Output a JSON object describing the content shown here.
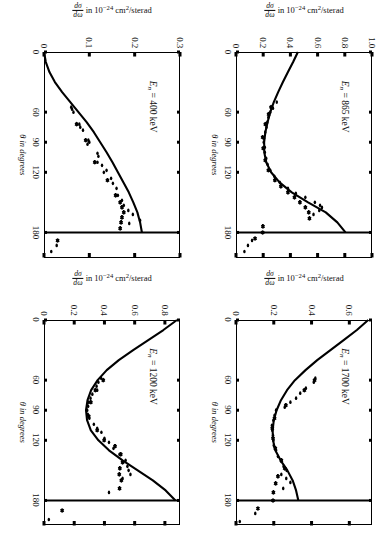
{
  "figure": {
    "panel_count": 4,
    "axis_titles": {
      "x": "θ in degrees",
      "y_numerator": "dσ",
      "y_denominator": "dω",
      "y_rest": " in 10⁻²⁴ cm²/sterad"
    }
  },
  "chart_data": [
    {
      "id": "panel-400kev",
      "type": "scatter",
      "title": "E_n = 400 keV",
      "energy_label": "E",
      "energy_sub": "n",
      "energy_value": "= 400 keV",
      "xlabel": "θ in degrees",
      "ylabel": "dσ/dω in 10⁻²⁴ cm²/sterad",
      "xlim": [
        0,
        205
      ],
      "ylim": [
        0,
        0.3
      ],
      "xticks": [
        0,
        60,
        90,
        120,
        180
      ],
      "xtick_labels": [
        "0",
        "60",
        "90",
        "120",
        "180"
      ],
      "yticks": [
        0,
        0.1,
        0.2,
        0.3
      ],
      "ytick_labels": [
        "0",
        "0.1",
        "0.2",
        "0.3"
      ],
      "grid": false,
      "legend": "none",
      "curve": [
        [
          0,
          0.0
        ],
        [
          10,
          0.004
        ],
        [
          20,
          0.012
        ],
        [
          30,
          0.024
        ],
        [
          40,
          0.04
        ],
        [
          50,
          0.058
        ],
        [
          60,
          0.076
        ],
        [
          70,
          0.094
        ],
        [
          80,
          0.11
        ],
        [
          90,
          0.124
        ],
        [
          100,
          0.138
        ],
        [
          110,
          0.151
        ],
        [
          120,
          0.163
        ],
        [
          130,
          0.175
        ],
        [
          140,
          0.187
        ],
        [
          150,
          0.197
        ],
        [
          160,
          0.206
        ],
        [
          170,
          0.212
        ],
        [
          180,
          0.216
        ]
      ],
      "vertical_line_x": 180,
      "points_filled": [
        [
          55,
          0.06
        ],
        [
          57,
          0.062
        ],
        [
          60,
          0.065
        ],
        [
          72,
          0.078
        ],
        [
          75,
          0.08
        ],
        [
          78,
          0.086
        ],
        [
          88,
          0.098
        ],
        [
          90,
          0.1
        ],
        [
          92,
          0.096
        ],
        [
          101,
          0.118
        ],
        [
          104,
          0.12
        ],
        [
          110,
          0.118
        ],
        [
          113,
          0.128
        ],
        [
          118,
          0.138
        ],
        [
          120,
          0.132
        ],
        [
          126,
          0.148
        ],
        [
          131,
          0.152
        ],
        [
          136,
          0.16
        ],
        [
          143,
          0.163
        ],
        [
          148,
          0.172
        ],
        [
          153,
          0.176
        ],
        [
          158,
          0.186
        ],
        [
          162,
          0.196
        ],
        [
          168,
          0.212
        ],
        [
          171,
          0.188
        ],
        [
          193,
          0.028
        ],
        [
          199,
          0.016
        ]
      ],
      "points_cross": [
        [
          72,
          0.072
        ],
        [
          88,
          0.092
        ],
        [
          110,
          0.112
        ],
        [
          128,
          0.14
        ],
        [
          143,
          0.158
        ],
        [
          150,
          0.168
        ],
        [
          155,
          0.172
        ],
        [
          160,
          0.176
        ],
        [
          165,
          0.172
        ],
        [
          170,
          0.17
        ],
        [
          176,
          0.168
        ],
        [
          188,
          0.03
        ]
      ]
    },
    {
      "id": "panel-865kev",
      "type": "scatter",
      "title": "E_n = 865 keV",
      "energy_label": "E",
      "energy_sub": "n",
      "energy_value": "= 865 keV",
      "xlabel": "θ in degrees",
      "ylabel": "dσ/dω in 10⁻²⁴ cm²/sterad",
      "xlim": [
        0,
        205
      ],
      "ylim": [
        0,
        1.0
      ],
      "xticks": [
        0,
        60,
        90,
        120,
        180
      ],
      "xtick_labels": [
        "0",
        "60",
        "90",
        "120",
        "180"
      ],
      "yticks": [
        0,
        0.2,
        0.4,
        0.6,
        0.8,
        1.0
      ],
      "ytick_labels": [
        "0",
        "0.2",
        "0.4",
        "0.6",
        "0.8",
        "1.0"
      ],
      "grid": false,
      "legend": "none",
      "curve": [
        [
          0,
          0.455
        ],
        [
          10,
          0.42
        ],
        [
          20,
          0.382
        ],
        [
          30,
          0.345
        ],
        [
          40,
          0.31
        ],
        [
          50,
          0.278
        ],
        [
          60,
          0.252
        ],
        [
          70,
          0.232
        ],
        [
          80,
          0.216
        ],
        [
          90,
          0.207
        ],
        [
          100,
          0.208
        ],
        [
          110,
          0.222
        ],
        [
          120,
          0.258
        ],
        [
          130,
          0.32
        ],
        [
          140,
          0.41
        ],
        [
          150,
          0.53
        ],
        [
          160,
          0.66
        ],
        [
          170,
          0.745
        ],
        [
          180,
          0.805
        ]
      ],
      "vertical_line_x": 180,
      "points_filled": [
        [
          50,
          0.3
        ],
        [
          56,
          0.272
        ],
        [
          60,
          0.252
        ],
        [
          65,
          0.238
        ],
        [
          70,
          0.23
        ],
        [
          75,
          0.224
        ],
        [
          80,
          0.215
        ],
        [
          86,
          0.206
        ],
        [
          90,
          0.204
        ],
        [
          95,
          0.212
        ],
        [
          100,
          0.212
        ],
        [
          106,
          0.222
        ],
        [
          112,
          0.232
        ],
        [
          118,
          0.252
        ],
        [
          124,
          0.282
        ],
        [
          130,
          0.322
        ],
        [
          136,
          0.382
        ],
        [
          141,
          0.44
        ],
        [
          145,
          0.51
        ],
        [
          150,
          0.58
        ],
        [
          153,
          0.618
        ],
        [
          155,
          0.632
        ],
        [
          158,
          0.612
        ],
        [
          162,
          0.57
        ],
        [
          188,
          0.118
        ],
        [
          193,
          0.088
        ],
        [
          199,
          0.062
        ]
      ],
      "points_cross": [
        [
          55,
          0.258
        ],
        [
          62,
          0.24
        ],
        [
          72,
          0.216
        ],
        [
          85,
          0.196
        ],
        [
          96,
          0.2
        ],
        [
          108,
          0.215
        ],
        [
          118,
          0.238
        ],
        [
          128,
          0.286
        ],
        [
          134,
          0.33
        ],
        [
          140,
          0.382
        ],
        [
          145,
          0.43
        ],
        [
          150,
          0.47
        ],
        [
          155,
          0.51
        ],
        [
          160,
          0.535
        ],
        [
          166,
          0.54
        ],
        [
          174,
          0.198
        ],
        [
          180,
          0.196
        ],
        [
          186,
          0.14
        ]
      ]
    },
    {
      "id": "panel-1200kev",
      "type": "scatter",
      "title": "E_n = 1200 keV",
      "energy_label": "E",
      "energy_sub": "n",
      "energy_value": "= 1200 keV",
      "xlabel": "θ in degrees",
      "ylabel": "dσ/dω in 10⁻²⁴ cm²/sterad",
      "xlim": [
        0,
        205
      ],
      "ylim": [
        0,
        0.9
      ],
      "xticks": [
        0,
        60,
        90,
        120,
        180
      ],
      "xtick_labels": [
        "0",
        "60",
        "90",
        "120",
        "180"
      ],
      "yticks": [
        0,
        0.2,
        0.4,
        0.6,
        0.8
      ],
      "ytick_labels": [
        "0",
        "0.2",
        "0.4",
        "0.6",
        "0.8"
      ],
      "grid": false,
      "legend": "none",
      "curve": [
        [
          0,
          0.88
        ],
        [
          10,
          0.79
        ],
        [
          20,
          0.69
        ],
        [
          30,
          0.59
        ],
        [
          40,
          0.495
        ],
        [
          50,
          0.415
        ],
        [
          60,
          0.355
        ],
        [
          70,
          0.312
        ],
        [
          80,
          0.288
        ],
        [
          90,
          0.278
        ],
        [
          100,
          0.285
        ],
        [
          110,
          0.31
        ],
        [
          120,
          0.36
        ],
        [
          130,
          0.43
        ],
        [
          140,
          0.52
        ],
        [
          150,
          0.62
        ],
        [
          160,
          0.72
        ],
        [
          170,
          0.805
        ],
        [
          180,
          0.87
        ]
      ],
      "vertical_line_x": 180,
      "points_filled": [
        [
          58,
          0.378
        ],
        [
          62,
          0.36
        ],
        [
          66,
          0.348
        ],
        [
          70,
          0.352
        ],
        [
          74,
          0.32
        ],
        [
          78,
          0.308
        ],
        [
          82,
          0.296
        ],
        [
          86,
          0.292
        ],
        [
          90,
          0.286
        ],
        [
          94,
          0.29
        ],
        [
          98,
          0.3
        ],
        [
          104,
          0.33
        ],
        [
          108,
          0.352
        ],
        [
          112,
          0.38
        ],
        [
          118,
          0.4
        ],
        [
          122,
          0.43
        ],
        [
          128,
          0.46
        ],
        [
          134,
          0.5
        ],
        [
          140,
          0.54
        ],
        [
          146,
          0.552
        ],
        [
          150,
          0.56
        ],
        [
          154,
          0.572
        ],
        [
          158,
          0.52
        ],
        [
          172,
          0.43
        ],
        [
          199,
          0.032
        ]
      ],
      "points_cross": [
        [
          60,
          0.392
        ],
        [
          70,
          0.34
        ],
        [
          82,
          0.31
        ],
        [
          96,
          0.296
        ],
        [
          110,
          0.352
        ],
        [
          120,
          0.398
        ],
        [
          126,
          0.47
        ],
        [
          134,
          0.508
        ],
        [
          142,
          0.52
        ],
        [
          148,
          0.502
        ],
        [
          154,
          0.498
        ],
        [
          160,
          0.512
        ],
        [
          168,
          0.5
        ],
        [
          190,
          0.12
        ]
      ]
    },
    {
      "id": "panel-1700kev",
      "type": "scatter",
      "title": "E_n = 1700 keV",
      "energy_label": "E",
      "energy_sub": "n",
      "energy_value": "= 1700 keV",
      "xlabel": "θ in degrees",
      "ylabel": "dσ/dω in 10⁻²⁴ cm²/sterad",
      "xlim": [
        0,
        205
      ],
      "ylim": [
        0,
        0.72
      ],
      "xticks": [
        0,
        60,
        90,
        120,
        180
      ],
      "xtick_labels": [
        "0",
        "60",
        "90",
        "120",
        "180"
      ],
      "yticks": [
        0,
        0.2,
        0.4,
        0.6
      ],
      "ytick_labels": [
        "0",
        "0.2",
        "0.4",
        "0.6"
      ],
      "grid": false,
      "legend": "none",
      "curve": [
        [
          0,
          0.7
        ],
        [
          10,
          0.64
        ],
        [
          20,
          0.57
        ],
        [
          30,
          0.5
        ],
        [
          40,
          0.43
        ],
        [
          50,
          0.368
        ],
        [
          60,
          0.312
        ],
        [
          70,
          0.27
        ],
        [
          80,
          0.238
        ],
        [
          90,
          0.215
        ],
        [
          100,
          0.2
        ],
        [
          110,
          0.194
        ],
        [
          120,
          0.196
        ],
        [
          130,
          0.208
        ],
        [
          140,
          0.236
        ],
        [
          150,
          0.272
        ],
        [
          160,
          0.3
        ],
        [
          170,
          0.318
        ],
        [
          180,
          0.33
        ]
      ],
      "vertical_line_x": 180,
      "points_filled": [
        [
          58,
          0.42
        ],
        [
          62,
          0.412
        ],
        [
          68,
          0.37
        ],
        [
          73,
          0.34
        ],
        [
          78,
          0.318
        ],
        [
          82,
          0.288
        ],
        [
          87,
          0.258
        ],
        [
          90,
          0.212
        ],
        [
          95,
          0.204
        ],
        [
          100,
          0.198
        ],
        [
          105,
          0.19
        ],
        [
          110,
          0.192
        ],
        [
          115,
          0.196
        ],
        [
          120,
          0.198
        ],
        [
          125,
          0.2
        ],
        [
          130,
          0.212
        ],
        [
          136,
          0.222
        ],
        [
          141,
          0.24
        ],
        [
          146,
          0.252
        ],
        [
          150,
          0.268
        ],
        [
          154,
          0.24
        ],
        [
          158,
          0.266
        ],
        [
          162,
          0.288
        ],
        [
          168,
          0.25
        ],
        [
          193,
          0.102
        ],
        [
          201,
          0.02
        ]
      ],
      "points_cross": [
        [
          60,
          0.416
        ],
        [
          70,
          0.362
        ],
        [
          85,
          0.264
        ],
        [
          98,
          0.204
        ],
        [
          108,
          0.192
        ],
        [
          118,
          0.196
        ],
        [
          128,
          0.208
        ],
        [
          140,
          0.24
        ],
        [
          148,
          0.258
        ],
        [
          156,
          0.222
        ],
        [
          163,
          0.21
        ],
        [
          172,
          0.198
        ],
        [
          180,
          0.196
        ],
        [
          188,
          0.116
        ]
      ]
    }
  ]
}
